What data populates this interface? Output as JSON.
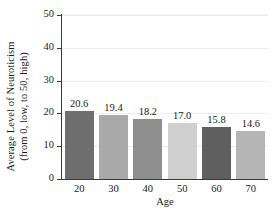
{
  "chart_data": {
    "type": "bar",
    "title": "",
    "xlabel": "Age",
    "ylabel_line1": "Average Level of Neuroticism",
    "ylabel_line2": "(from 0, low, to 50, high)",
    "categories": [
      "20",
      "30",
      "40",
      "50",
      "60",
      "70"
    ],
    "values": [
      20.6,
      19.4,
      18.2,
      17.0,
      15.8,
      14.6
    ],
    "value_labels": [
      "20.6",
      "19.4",
      "18.2",
      "17.0",
      "15.8",
      "14.6"
    ],
    "ylim": [
      0,
      50
    ],
    "yticks": [
      0,
      10,
      20,
      30,
      40,
      50
    ],
    "ytick_labels": [
      "0",
      "10",
      "20",
      "30",
      "40",
      "50"
    ],
    "grid": true,
    "legend": "none",
    "bar_colors": [
      "#6e6e6e",
      "#a9a9a9",
      "#8f8f8f",
      "#cfcfcf",
      "#5f5f5f",
      "#b5b5b5"
    ],
    "axis_color": "#3a3a3a",
    "grid_color": "#ececed",
    "text_color": "#1a1a1a"
  }
}
